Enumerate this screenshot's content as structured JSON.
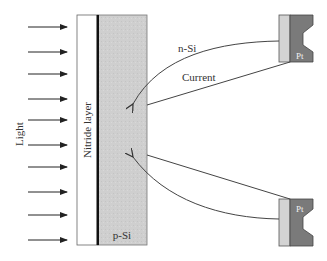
{
  "diagram": {
    "labels": {
      "light": "Light",
      "nitride_layer": "Nitride layer",
      "p_si": "p-Si",
      "n_si": "n-Si",
      "current": "Current",
      "pt_top": "Pt",
      "pt_bottom": "Pt"
    },
    "colors": {
      "p_si_fill": "#cfcfcf",
      "nitride_fill": "#ffffff",
      "junction_line": "#111111",
      "pt_light": "#d3d3d3",
      "pt_dark": "#7a7a7a",
      "line": "#444444"
    },
    "light_arrows_y": [
      27,
      52,
      74,
      99,
      120,
      145,
      167,
      192,
      215,
      240
    ]
  }
}
